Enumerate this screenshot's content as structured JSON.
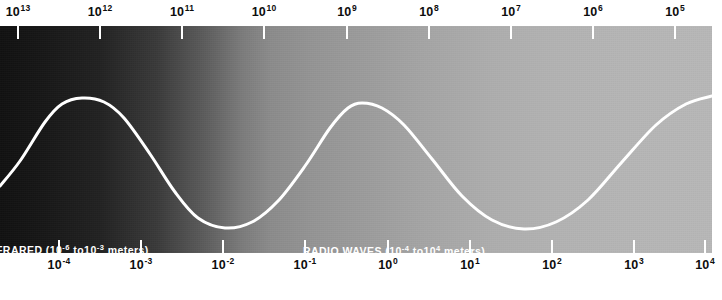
{
  "figure": {
    "kind": "electromagnetic-spectrum-band",
    "width": 722,
    "height": 300,
    "band": {
      "left": 0,
      "top": 26,
      "width": 712,
      "height": 227,
      "gradient_from": "#111111",
      "gradient_to": "#b8b8b8"
    },
    "wave_color": "#ffffff",
    "tick_color": "#ffffff",
    "text_color": "#0d0d0d",
    "background": "#ffffff"
  },
  "top_axis": {
    "name": "frequency-axis",
    "ticks": [
      {
        "base": "10",
        "exponent": "13",
        "x": 18
      },
      {
        "base": "10",
        "exponent": "12",
        "x": 100
      },
      {
        "base": "10",
        "exponent": "11",
        "x": 182
      },
      {
        "base": "10",
        "exponent": "10",
        "x": 264
      },
      {
        "base": "10",
        "exponent": "9",
        "x": 347
      },
      {
        "base": "10",
        "exponent": "8",
        "x": 429
      },
      {
        "base": "10",
        "exponent": "7",
        "x": 511
      },
      {
        "base": "10",
        "exponent": "6",
        "x": 593
      },
      {
        "base": "10",
        "exponent": "5",
        "x": 675
      }
    ]
  },
  "bottom_axis": {
    "name": "wavelength-axis",
    "ticks": [
      {
        "base": "10",
        "exponent": "-4",
        "x": 59
      },
      {
        "base": "10",
        "exponent": "-3",
        "x": 141
      },
      {
        "base": "10",
        "exponent": "-2",
        "x": 223
      },
      {
        "base": "10",
        "exponent": "-1",
        "x": 305
      },
      {
        "base": "10",
        "exponent": "0",
        "x": 388
      },
      {
        "base": "10",
        "exponent": "1",
        "x": 470
      },
      {
        "base": "10",
        "exponent": "2",
        "x": 552
      },
      {
        "base": "10",
        "exponent": "3",
        "x": 634
      },
      {
        "base": "10",
        "exponent": "4",
        "x": 705
      }
    ]
  },
  "regions": [
    {
      "id": "infrared",
      "name": "FRARED",
      "range_prefix": "(10",
      "range_exp_low": "-6",
      "range_mid": " to10",
      "range_exp_high": "-3",
      "range_suffix": " meters)",
      "full_text": "FRARED (10-6 to10-3 meters)"
    },
    {
      "id": "radio-waves",
      "name": "RADIO WAVES",
      "range_prefix": "(10",
      "range_exp_low": "-4",
      "range_mid": " to10",
      "range_exp_high": "4",
      "range_suffix": " meters)",
      "full_text": "RADIO WAVES (10-4 to104 meters)"
    }
  ],
  "chart_data": {
    "type": "line",
    "title": "",
    "xlabel": "",
    "ylabel": "",
    "curve_points": [
      {
        "x": 0,
        "y": 160
      },
      {
        "x": 20,
        "y": 135
      },
      {
        "x": 45,
        "y": 96
      },
      {
        "x": 62,
        "y": 78
      },
      {
        "x": 82,
        "y": 72
      },
      {
        "x": 104,
        "y": 76
      },
      {
        "x": 124,
        "y": 92
      },
      {
        "x": 150,
        "y": 128
      },
      {
        "x": 175,
        "y": 166
      },
      {
        "x": 198,
        "y": 192
      },
      {
        "x": 225,
        "y": 202
      },
      {
        "x": 252,
        "y": 196
      },
      {
        "x": 278,
        "y": 175
      },
      {
        "x": 305,
        "y": 140
      },
      {
        "x": 330,
        "y": 102
      },
      {
        "x": 348,
        "y": 82
      },
      {
        "x": 362,
        "y": 77
      },
      {
        "x": 382,
        "y": 82
      },
      {
        "x": 404,
        "y": 99
      },
      {
        "x": 432,
        "y": 133
      },
      {
        "x": 462,
        "y": 170
      },
      {
        "x": 492,
        "y": 194
      },
      {
        "x": 524,
        "y": 203
      },
      {
        "x": 556,
        "y": 196
      },
      {
        "x": 588,
        "y": 174
      },
      {
        "x": 622,
        "y": 136
      },
      {
        "x": 656,
        "y": 99
      },
      {
        "x": 686,
        "y": 78
      },
      {
        "x": 712,
        "y": 70
      }
    ],
    "peaks": [
      {
        "x": 82,
        "y": 72
      },
      {
        "x": 362,
        "y": 77
      }
    ],
    "troughs": [
      {
        "x": 225,
        "y": 202
      },
      {
        "x": 524,
        "y": 203
      }
    ]
  }
}
